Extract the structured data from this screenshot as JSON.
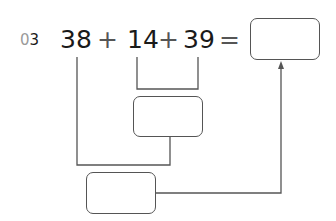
{
  "problem": {
    "number_prefix": "0",
    "number_digit": "3",
    "terms": [
      "38",
      "14",
      "39"
    ],
    "operators": [
      "+",
      "+"
    ],
    "equals": "="
  },
  "boxes": {
    "answer": "",
    "middle_sum": "",
    "bottom_sum": ""
  },
  "colors": {
    "text": "#1a1a1a",
    "line": "#555555",
    "number_prefix": "#9a9a9a"
  }
}
